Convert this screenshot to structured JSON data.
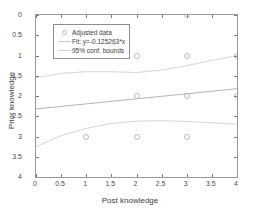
{
  "chart_data": {
    "type": "scatter",
    "title": "",
    "xlabel": "Post knowledge",
    "ylabel": "Prior knowledge",
    "xlim": [
      0,
      4
    ],
    "ylim": [
      0,
      4
    ],
    "y_axis_reversed": true,
    "grid": false,
    "xticks": [
      "0",
      "0.5",
      "1",
      "1.5",
      "2",
      "2.5",
      "3",
      "3.5",
      "4"
    ],
    "xtick_values": [
      0,
      0.5,
      1,
      1.5,
      2,
      2.5,
      3,
      3.5,
      4
    ],
    "yticks": [
      "0",
      "0.5",
      "1",
      "1.5",
      "2",
      "2.5",
      "3",
      "3.5",
      "4"
    ],
    "ytick_values": [
      0,
      0.5,
      1,
      1.5,
      2,
      2.5,
      3,
      3.5,
      4
    ],
    "legend_position": "top-left",
    "series": [
      {
        "name": "Adjusted data",
        "type": "scatter",
        "marker": "circle-open",
        "color": "#b9b9c4",
        "points": [
          {
            "x": 3,
            "y": 0
          },
          {
            "x": 2,
            "y": 1
          },
          {
            "x": 3,
            "y": 1
          },
          {
            "x": 4,
            "y": 1
          },
          {
            "x": 2,
            "y": 2
          },
          {
            "x": 3,
            "y": 2
          },
          {
            "x": 4,
            "y": 2
          },
          {
            "x": 1,
            "y": 3
          },
          {
            "x": 2,
            "y": 3
          },
          {
            "x": 3,
            "y": 3
          }
        ]
      },
      {
        "name": "Fit: y=-0.125263*x",
        "type": "line",
        "color": "#b3b3bd",
        "equation": "y=-0.125263*x",
        "endpoints": [
          {
            "x": 0,
            "y": 2.32
          },
          {
            "x": 4,
            "y": 1.82
          }
        ]
      },
      {
        "name": "95% conf. bounds",
        "type": "line",
        "color": "#d0d0d9",
        "upper_bound": [
          {
            "x": 0,
            "y": 1.55
          },
          {
            "x": 0.5,
            "y": 1.44
          },
          {
            "x": 1,
            "y": 1.4
          },
          {
            "x": 1.5,
            "y": 1.4
          },
          {
            "x": 2,
            "y": 1.42
          },
          {
            "x": 2.5,
            "y": 1.36
          },
          {
            "x": 3,
            "y": 1.25
          },
          {
            "x": 3.5,
            "y": 1.12
          },
          {
            "x": 4,
            "y": 1.0
          }
        ],
        "lower_bound": [
          {
            "x": 0,
            "y": 3.25
          },
          {
            "x": 0.5,
            "y": 2.98
          },
          {
            "x": 1,
            "y": 2.8
          },
          {
            "x": 1.5,
            "y": 2.68
          },
          {
            "x": 2,
            "y": 2.62
          },
          {
            "x": 2.5,
            "y": 2.61
          },
          {
            "x": 3,
            "y": 2.63
          },
          {
            "x": 3.5,
            "y": 2.66
          },
          {
            "x": 4,
            "y": 2.7
          }
        ]
      }
    ]
  },
  "legend": {
    "items": [
      {
        "label": "Adjusted data",
        "key": "marker"
      },
      {
        "label": "Fit: y=-0.125263*x",
        "key": "line"
      },
      {
        "label": "95% conf. bounds",
        "key": "dash"
      }
    ]
  },
  "axes": {
    "x_title": "Post knowledge",
    "y_title": "Prior knowledge"
  }
}
